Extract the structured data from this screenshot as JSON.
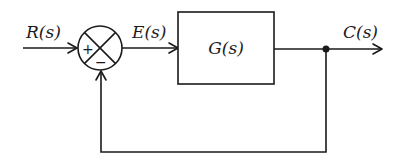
{
  "diagram": {
    "type": "negative-feedback-block-diagram",
    "signals": {
      "input": "R(s)",
      "error": "E(s)",
      "output": "C(s)"
    },
    "blocks": {
      "forward": "G(s)"
    },
    "summing_junction": {
      "top_left_sign": "+",
      "bottom_sign": "−"
    },
    "feedback": "unity"
  }
}
